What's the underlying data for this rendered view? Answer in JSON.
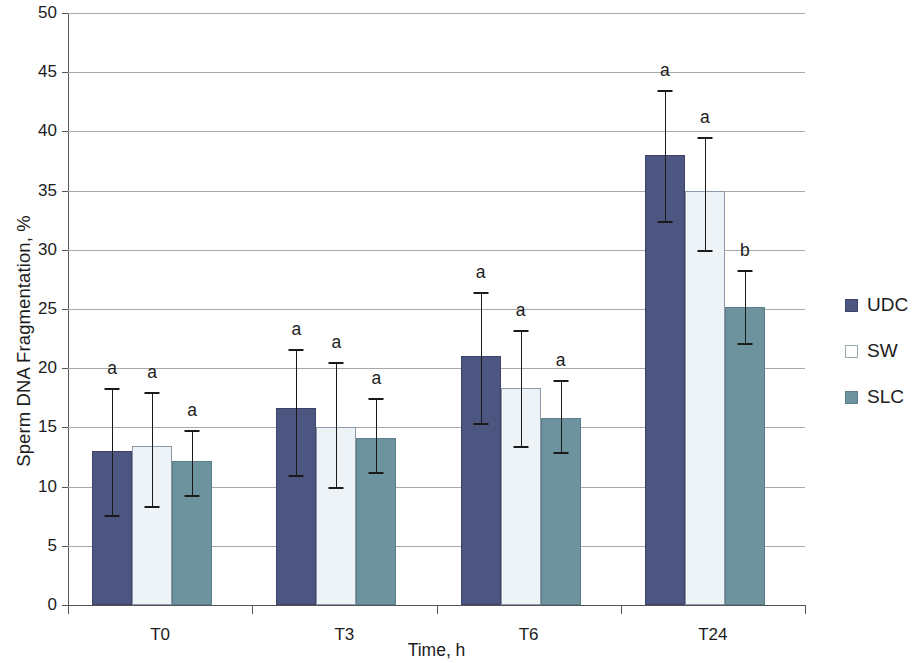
{
  "chart_data": {
    "type": "bar",
    "title": "",
    "xlabel": "Time, h",
    "ylabel": "Sperm DNA Fragmentation, %",
    "categories": [
      "T0",
      "T3",
      "T6",
      "T24"
    ],
    "ylim": [
      0,
      50
    ],
    "yticks": [
      0,
      5,
      10,
      15,
      20,
      25,
      30,
      35,
      40,
      45,
      50
    ],
    "ytick_labels": [
      "0",
      "5",
      "10",
      "15",
      "20",
      "25",
      "30",
      "35",
      "40",
      "45",
      "50"
    ],
    "grid": true,
    "legend_position": "right",
    "series": [
      {
        "name": "UDC",
        "color": "#4c5680",
        "values": [
          13.0,
          16.6,
          21.0,
          38.0
        ],
        "error_upper": [
          18.3,
          21.6,
          26.4,
          43.5
        ],
        "error_lower": [
          7.6,
          11.0,
          15.4,
          32.4
        ],
        "sig_letters": [
          "a",
          "a",
          "a",
          "a"
        ]
      },
      {
        "name": "SW",
        "color": "#eef3f7",
        "values": [
          13.4,
          15.0,
          18.3,
          35.0
        ],
        "error_upper": [
          18.0,
          20.5,
          23.2,
          39.5
        ],
        "error_lower": [
          8.4,
          10.0,
          13.4,
          30.0
        ],
        "sig_letters": [
          "a",
          "a",
          "a",
          "a"
        ]
      },
      {
        "name": "SLC",
        "color": "#6d939f",
        "values": [
          12.2,
          14.1,
          15.8,
          25.2
        ],
        "error_upper": [
          14.8,
          17.5,
          19.0,
          28.3
        ],
        "error_lower": [
          9.3,
          11.2,
          12.9,
          22.1
        ],
        "sig_letters": [
          "a",
          "a",
          "a",
          "b"
        ]
      }
    ]
  },
  "legend": {
    "items": [
      {
        "label": "UDC",
        "swatch": "series-udc"
      },
      {
        "label": "SW",
        "swatch": "series-sw"
      },
      {
        "label": "SLC",
        "swatch": "series-slc"
      }
    ]
  },
  "axes": {
    "y_title": "Sperm DNA Fragmentation, %",
    "x_title": "Time, h"
  }
}
